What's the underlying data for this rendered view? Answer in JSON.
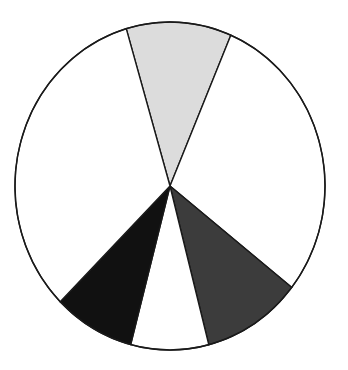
{
  "chart_data": {
    "type": "pie",
    "title": "",
    "subtitle": "",
    "xlabel": "",
    "ylabel": "",
    "legend": "none",
    "grid": false,
    "labels_shown": false,
    "center": {
      "x": 170,
      "y": 186
    },
    "radius": {
      "rx": 155,
      "ry": 164
    },
    "start_angle_deg": -106.4,
    "direction": "clockwise",
    "outline_color": "#1a1a1a",
    "outline_width": 1.4,
    "categories": [
      "Slice 1",
      "Slice 2",
      "Slice 3",
      "Slice 4",
      "Slice 5",
      "Slice 6"
    ],
    "values": [
      39.5,
      105.1,
      37.3,
      29.2,
      30.4,
      118.5
    ],
    "percentages": [
      11.0,
      29.2,
      10.4,
      8.1,
      8.4,
      32.9
    ],
    "angles_deg": [
      39.5,
      105.1,
      37.3,
      29.2,
      30.4,
      118.5
    ],
    "colors": [
      "#dcdcdc",
      "#ffffff",
      "#3c3c3c",
      "#ffffff",
      "#111111",
      "#ffffff"
    ],
    "slices": [
      {
        "name": "Slice 1",
        "fill": "#dcdcdc",
        "start_deg": -106.4,
        "end_deg": -66.9,
        "angle_deg": 39.5,
        "percent": 11.0,
        "shade": "light-gray"
      },
      {
        "name": "Slice 2",
        "fill": "#ffffff",
        "start_deg": -66.9,
        "end_deg": 38.2,
        "angle_deg": 105.1,
        "percent": 29.2,
        "shade": "white"
      },
      {
        "name": "Slice 3",
        "fill": "#3c3c3c",
        "start_deg": 38.2,
        "end_deg": 75.5,
        "angle_deg": 37.3,
        "percent": 10.4,
        "shade": "dark-gray"
      },
      {
        "name": "Slice 4",
        "fill": "#ffffff",
        "start_deg": 75.5,
        "end_deg": 104.7,
        "angle_deg": 29.2,
        "percent": 8.1,
        "shade": "white"
      },
      {
        "name": "Slice 5",
        "fill": "#111111",
        "start_deg": 104.7,
        "end_deg": 135.1,
        "angle_deg": 30.4,
        "percent": 8.4,
        "shade": "black"
      },
      {
        "name": "Slice 6",
        "fill": "#ffffff",
        "start_deg": 135.1,
        "end_deg": 253.6,
        "angle_deg": 118.5,
        "percent": 32.9,
        "shade": "white"
      }
    ],
    "background_color": "#ffffff"
  },
  "figure": {
    "width": 348,
    "height": 370
  }
}
